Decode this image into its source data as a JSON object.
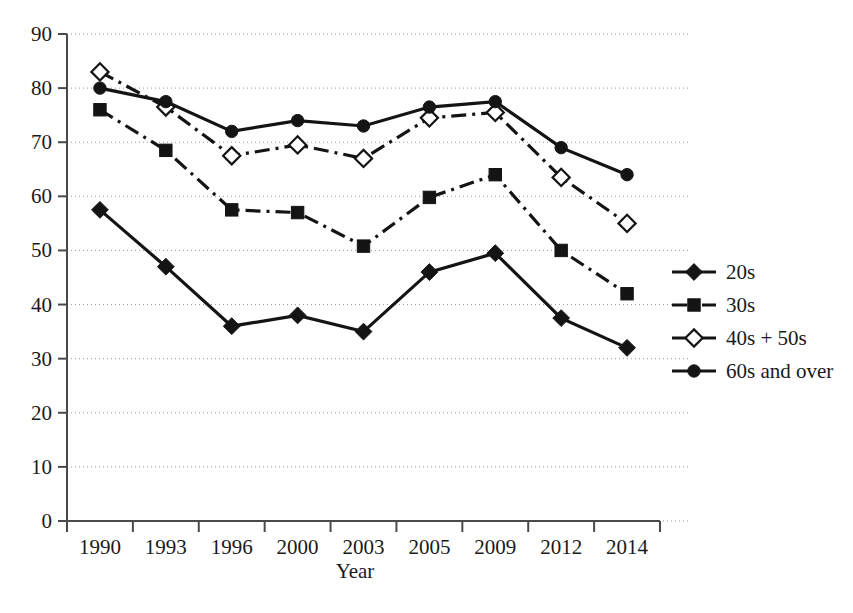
{
  "chart_data": {
    "type": "line",
    "title": "",
    "xlabel": "Year",
    "ylabel": "",
    "categories": [
      "1990",
      "1993",
      "1996",
      "2000",
      "2003",
      "2005",
      "2009",
      "2012",
      "2014"
    ],
    "ylim": [
      0,
      90
    ],
    "ytick_step": 10,
    "yticks": [
      "0",
      "10",
      "20",
      "30",
      "40",
      "50",
      "60",
      "70",
      "80",
      "90"
    ],
    "grid": "horizontal-dotted",
    "legend_position": "right",
    "series": [
      {
        "name": "20s",
        "marker": "filled-diamond",
        "line_style": "solid",
        "values": [
          57.5,
          47,
          36,
          38,
          35,
          46,
          49.5,
          37.5,
          32
        ]
      },
      {
        "name": "30s",
        "marker": "filled-square",
        "line_style": "dash-dot",
        "values": [
          76,
          68.5,
          57.5,
          57,
          50.8,
          59.8,
          64,
          50,
          42
        ]
      },
      {
        "name": "40s + 50s",
        "marker": "open-diamond",
        "line_style": "dash-dot",
        "values": [
          83,
          76.5,
          67.5,
          69.5,
          67,
          74.5,
          75.5,
          63.5,
          55
        ]
      },
      {
        "name": "60s and over",
        "marker": "filled-circle",
        "line_style": "solid",
        "values": [
          80,
          77.5,
          72,
          74,
          73,
          76.5,
          77.5,
          69,
          64
        ]
      }
    ]
  },
  "colors": {
    "line": "#141414",
    "grid": "#9a9a9a",
    "axis": "#4a4a4a",
    "background": "#ffffff",
    "text": "#1a1a1a"
  },
  "legend": {
    "items": [
      {
        "label": "20s",
        "marker": "filled-diamond",
        "line_style": "solid"
      },
      {
        "label": "30s",
        "marker": "filled-square",
        "line_style": "dash-dot"
      },
      {
        "label": "40s + 50s",
        "marker": "open-diamond",
        "line_style": "dash-dot"
      },
      {
        "label": "60s and over",
        "marker": "filled-circle",
        "line_style": "solid"
      }
    ]
  }
}
